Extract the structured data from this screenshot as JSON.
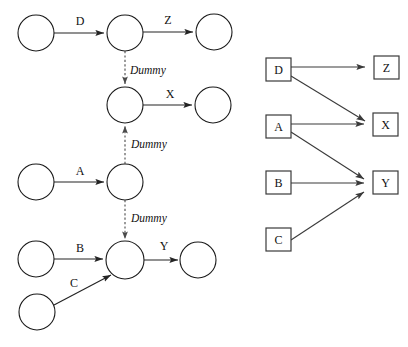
{
  "diagram": {
    "type": "network-diagram",
    "background_color": "#ffffff",
    "line_color": "#242424",
    "dummy_line_color": "#4a4a4a",
    "node_fill_color": "#ffffff"
  },
  "aoa_panel": {
    "name": "activity-on-arrow-network",
    "event_nodes": [
      {
        "id": "e1",
        "cx": 36,
        "cy": 33,
        "r": 18
      },
      {
        "id": "e2",
        "cx": 125,
        "cy": 33,
        "r": 18
      },
      {
        "id": "e3",
        "cx": 214,
        "cy": 32,
        "r": 18
      },
      {
        "id": "e4",
        "cx": 125,
        "cy": 105,
        "r": 18
      },
      {
        "id": "e5",
        "cx": 213,
        "cy": 105,
        "r": 18
      },
      {
        "id": "e6",
        "cx": 36,
        "cy": 182,
        "r": 18
      },
      {
        "id": "e7",
        "cx": 125,
        "cy": 182,
        "r": 18
      },
      {
        "id": "e8",
        "cx": 36,
        "cy": 259,
        "r": 18
      },
      {
        "id": "e9",
        "cx": 125,
        "cy": 260,
        "r": 19
      },
      {
        "id": "e10",
        "cx": 198,
        "cy": 260,
        "r": 18
      },
      {
        "id": "e11",
        "cx": 37,
        "cy": 312,
        "r": 18
      }
    ],
    "activity_edges": [
      {
        "label": "D",
        "from": "e1",
        "to": "e2",
        "label_x": 80,
        "label_y": 25
      },
      {
        "label": "Z",
        "from": "e2",
        "to": "e3",
        "label_x": 168,
        "label_y": 24
      },
      {
        "label": "X",
        "from": "e4",
        "to": "e5",
        "label_x": 170,
        "label_y": 98
      },
      {
        "label": "A",
        "from": "e6",
        "to": "e7",
        "label_x": 80,
        "label_y": 175
      },
      {
        "label": "B",
        "from": "e8",
        "to": "e9",
        "label_x": 80,
        "label_y": 252
      },
      {
        "label": "C",
        "from": "e11",
        "to": "e9",
        "label_x": 74,
        "label_y": 287
      },
      {
        "label": "Y",
        "from": "e9",
        "to": "e10",
        "label_x": 164,
        "label_y": 250
      }
    ],
    "dummy_edges": [
      {
        "label": "Dummy",
        "from": "e2",
        "to": "e4",
        "label_x": 130,
        "label_y": 74
      },
      {
        "label": "Dummy",
        "from": "e7",
        "to": "e4",
        "label_x": 131,
        "label_y": 148
      },
      {
        "label": "Dummy",
        "from": "e7",
        "to": "e9",
        "label_x": 131,
        "label_y": 222
      }
    ]
  },
  "aon_panel": {
    "name": "activity-on-node-precedence-diagram",
    "nodes": [
      {
        "label": "D",
        "x": 266,
        "y": 58,
        "w": 25,
        "h": 23
      },
      {
        "label": "Z",
        "x": 374,
        "y": 56,
        "w": 25,
        "h": 23
      },
      {
        "label": "A",
        "x": 266,
        "y": 115,
        "w": 25,
        "h": 23
      },
      {
        "label": "X",
        "x": 373,
        "y": 113,
        "w": 25,
        "h": 23
      },
      {
        "label": "B",
        "x": 266,
        "y": 171,
        "w": 25,
        "h": 23
      },
      {
        "label": "Y",
        "x": 373,
        "y": 171,
        "w": 25,
        "h": 23
      },
      {
        "label": "C",
        "x": 266,
        "y": 228,
        "w": 25,
        "h": 23
      }
    ],
    "edges": [
      {
        "from": "D",
        "to": "Z"
      },
      {
        "from": "D",
        "to": "X"
      },
      {
        "from": "A",
        "to": "X"
      },
      {
        "from": "A",
        "to": "Y"
      },
      {
        "from": "B",
        "to": "Y"
      },
      {
        "from": "C",
        "to": "Y"
      }
    ]
  }
}
